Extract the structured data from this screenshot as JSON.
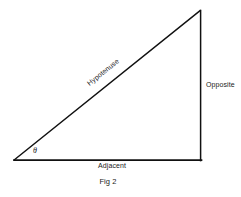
{
  "figure": {
    "caption": "Fig 2",
    "background_color": "#ffffff",
    "stroke_color": "#111111",
    "text_color": "#1a1a1a",
    "width": 241,
    "height": 197
  },
  "diagram": {
    "type": "right-triangle",
    "vertices": {
      "angle_vertex": {
        "x": 14,
        "y": 160
      },
      "right_angle_vertex": {
        "x": 201,
        "y": 160
      },
      "top_vertex": {
        "x": 200,
        "y": 10
      }
    },
    "sides": {
      "hypotenuse_label": "Hypotenuse",
      "opposite_label": "Opposite",
      "adjacent_label": "Adjacent"
    },
    "angle_symbol": "θ",
    "hypotenuse_rotation_deg": -38.7
  }
}
